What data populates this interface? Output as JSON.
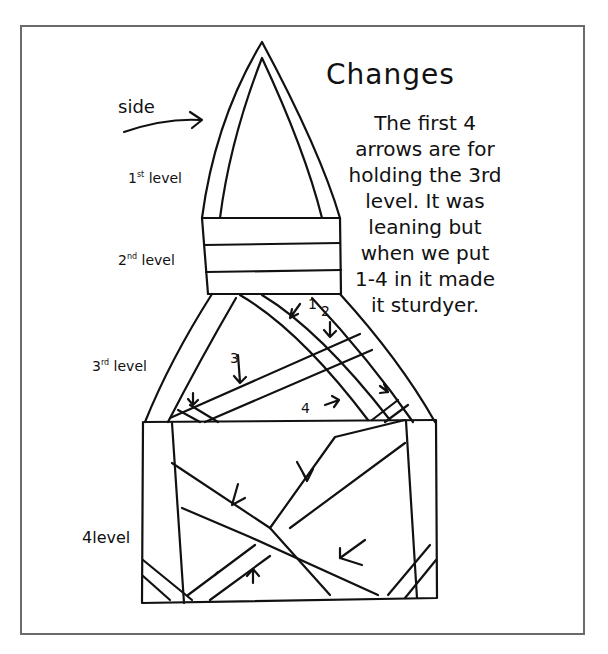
{
  "title": "Changes",
  "side_label": "side",
  "notes": [
    "The first 4",
    "arrows are for",
    "holding the 3rd",
    "level. It was",
    "leaning but",
    "when we put",
    "1-4 in it made",
    "it sturdyer."
  ],
  "levels": [
    {
      "num": "1",
      "sup": "st",
      "word": "level"
    },
    {
      "num": "2",
      "sup": "nd",
      "word": "level"
    },
    {
      "num": "3",
      "sup": "rd",
      "word": "level"
    },
    {
      "num": "4",
      "sup": "",
      "word": "level"
    }
  ],
  "arrow_numbers": [
    "1",
    "2",
    "3",
    "4"
  ],
  "colors": {
    "ink": "#111111",
    "frame": "#6a6a6a",
    "paper": "#ffffff"
  }
}
